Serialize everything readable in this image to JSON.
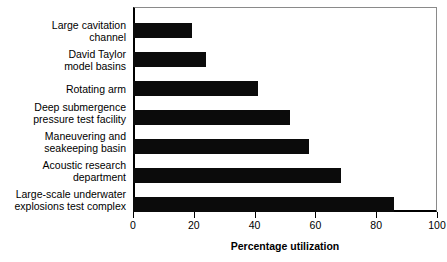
{
  "chart_data": {
    "type": "bar",
    "orientation": "horizontal",
    "title": "",
    "xlabel": "Percentage utilization",
    "ylabel": "",
    "xlim": [
      0,
      100
    ],
    "xticks": [
      "0",
      "20",
      "40",
      "60",
      "80",
      "100"
    ],
    "xtick_values": [
      0,
      20,
      40,
      60,
      80,
      100
    ],
    "grid": false,
    "legend": null,
    "bar_color": "#0b0b0b",
    "categories": [
      "Large cavitation\nchannel",
      "David Taylor\nmodel basins",
      "Rotating arm",
      "Deep submergence\npressure test facility",
      "Maneuvering and\nseakeeping basin",
      "Acoustic research\ndepartment",
      "Large-scale underwater\nexplosions test complex"
    ],
    "values": [
      19.5,
      24,
      41,
      51.5,
      58,
      68.5,
      86
    ]
  }
}
